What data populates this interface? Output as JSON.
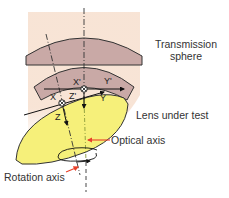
{
  "labels": {
    "transmission_sphere": [
      "Transmission",
      "sphere"
    ],
    "lens_under_test": "Lens under test",
    "optical_axis": "Optical axis",
    "rotation_axis": "Rotation axis"
  },
  "axes": {
    "upper": {
      "x": "X'",
      "y": "Y'",
      "z": "Z'"
    },
    "lower": {
      "x": "X",
      "y": "Y",
      "z": "Z"
    }
  },
  "colors": {
    "background_peach": "#f7e1d1",
    "sphere_fill": "#c9a9a6",
    "lens_fill": "#f6f07a",
    "outline": "#333333",
    "pointer_arrow": "#e8402a",
    "optical_axis_line": "#8a9a3a"
  }
}
